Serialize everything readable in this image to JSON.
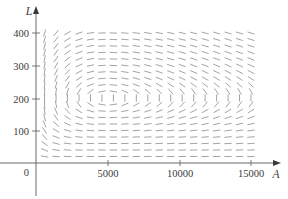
{
  "chart_data": {
    "type": "direction-field",
    "title": "",
    "xlabel": "A",
    "ylabel": "L",
    "origin_label": "0",
    "x_ticks": [
      5000,
      10000,
      15000
    ],
    "x_tick_labels": [
      "5000",
      "10000",
      "15000"
    ],
    "y_ticks": [
      100,
      200,
      300,
      400
    ],
    "y_tick_labels": [
      "100",
      "200",
      "300",
      "400"
    ],
    "xlim": [
      0,
      16000
    ],
    "ylim": [
      -100,
      440
    ],
    "grid": false,
    "legend": null,
    "system": {
      "description": "dA/dt = 2A - 0.01AL, dL/dt = -0.5L + 0.0001AL",
      "a": 2,
      "b": 0.01,
      "c": 0.5,
      "d": 0.0001
    },
    "equilibrium": {
      "A": 5000,
      "L": 200
    },
    "sample_grid": {
      "A_start": 600,
      "A_step": 800,
      "A_count": 19,
      "L_start": 20,
      "L_step": 20,
      "L_count": 20
    },
    "segment_color": "#9a9a9a",
    "axis_color": "#5a5a5a"
  }
}
